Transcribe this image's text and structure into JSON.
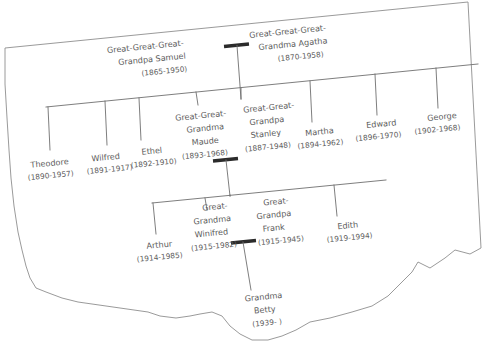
{
  "document": {
    "type": "hand-drawn family tree chart on torn paper",
    "title": "Family Tree",
    "ink_color": "#5c5c5c",
    "paper_color": "#ffffff",
    "edge_color": "#8e8e8e",
    "marriage_bar_color": "#2b2b2b",
    "rotation_degrees": -6
  },
  "generations": [
    {
      "index": 1,
      "label": "great-great-great-grandparents",
      "people": [
        {
          "name": "Great-Great-Great-Grandpa Samuel",
          "line1": "Great-Great-Great-",
          "line2": "Grandpa Samuel",
          "dates": "(1865-1950)",
          "birth": "1865",
          "death": "1950"
        },
        {
          "name": "Great-Great-Great-Grandma Agatha",
          "line1": "Great-Great-Great-",
          "line2": "Grandma Agatha",
          "dates": "(1870-1958)",
          "birth": "1870",
          "death": "1958"
        }
      ],
      "marriage": true
    },
    {
      "index": 2,
      "label": "great-great-grandparents and siblings",
      "people": [
        {
          "name": "Theodore",
          "line1": "Theodore",
          "dates": "(1890-1957)",
          "birth": "1890",
          "death": "1957"
        },
        {
          "name": "Wilfred",
          "line1": "Wilfred",
          "dates": "(1891-1917)",
          "birth": "1891",
          "death": "1917"
        },
        {
          "name": "Ethel",
          "line1": "Ethel",
          "dates": "(1892-1910)",
          "birth": "1892",
          "death": "1910"
        },
        {
          "name": "Great-Great-Grandma Maude",
          "line1": "Great-Great-",
          "line2": "Grandma",
          "line3": "Maude",
          "dates": "(1893-1968)",
          "birth": "1893",
          "death": "1968"
        },
        {
          "name": "Great-Great-Grandpa Stanley",
          "line1": "Great-Great-",
          "line2": "Grandpa",
          "line3": "Stanley",
          "dates": "(1887-1948)",
          "birth": "1887",
          "death": "1948"
        },
        {
          "name": "Martha",
          "line1": "Martha",
          "dates": "(1894-1962)",
          "birth": "1894",
          "death": "1962"
        },
        {
          "name": "Edward",
          "line1": "Edward",
          "dates": "(1896-1970)",
          "birth": "1896",
          "death": "1970"
        },
        {
          "name": "George",
          "line1": "George",
          "dates": "(1902-1968)",
          "birth": "1902",
          "death": "1968"
        }
      ],
      "marriage": true
    },
    {
      "index": 3,
      "label": "great-grandparents and siblings",
      "people": [
        {
          "name": "Arthur",
          "line1": "Arthur",
          "dates": "(1914-1985)",
          "birth": "1914",
          "death": "1985"
        },
        {
          "name": "Great-Grandma Winifred",
          "line1": "Great-",
          "line2": "Grandma",
          "line3": "Winifred",
          "dates": "(1915-1982)",
          "birth": "1915",
          "death": "1982"
        },
        {
          "name": "Great-Grandpa Frank",
          "line1": "Great-",
          "line2": "Grandpa",
          "line3": "Frank",
          "dates": "(1915-1945)",
          "birth": "1915",
          "death": "1945"
        },
        {
          "name": "Edith",
          "line1": "Edith",
          "dates": "(1919-1994)",
          "birth": "1919",
          "death": "1994"
        }
      ],
      "marriage": true
    },
    {
      "index": 4,
      "label": "grandmother",
      "people": [
        {
          "name": "Grandma Betty",
          "line1": "Grandma",
          "line2": "Betty",
          "dates": "(1939-    )",
          "birth": "1939",
          "death": ""
        }
      ],
      "marriage": false
    }
  ],
  "labels": {
    "g1_samuel_l1": "Great-Great-Great-",
    "g1_samuel_l2": "Grandpa Samuel",
    "g1_samuel_dates": "(1865-1950)",
    "g1_agatha_l1": "Great-Great-Great-",
    "g1_agatha_l2": "Grandma Agatha",
    "g1_agatha_dates": "(1870-1958)",
    "g2_theodore": "Theodore",
    "g2_theodore_dates": "(1890-1957)",
    "g2_wilfred": "Wilfred",
    "g2_wilfred_dates": "(1891-1917)",
    "g2_ethel": "Ethel",
    "g2_ethel_dates": "(1892-1910)",
    "g2_maude_l1": "Great-Great-",
    "g2_maude_l2": "Grandma",
    "g2_maude_l3": "Maude",
    "g2_maude_dates": "(1893-1968)",
    "g2_stanley_l1": "Great-Great-",
    "g2_stanley_l2": "Grandpa",
    "g2_stanley_l3": "Stanley",
    "g2_stanley_dates": "(1887-1948)",
    "g2_martha": "Martha",
    "g2_martha_dates": "(1894-1962)",
    "g2_edward": "Edward",
    "g2_edward_dates": "(1896-1970)",
    "g2_george": "George",
    "g2_george_dates": "(1902-1968)",
    "g3_arthur": "Arthur",
    "g3_arthur_dates": "(1914-1985)",
    "g3_winifred_l1": "Great-",
    "g3_winifred_l2": "Grandma",
    "g3_winifred_l3": "Winifred",
    "g3_winifred_dates": "(1915-1982)",
    "g3_frank_l1": "Great-",
    "g3_frank_l2": "Grandpa",
    "g3_frank_l3": "Frank",
    "g3_frank_dates": "(1915-1945)",
    "g3_edith": "Edith",
    "g3_edith_dates": "(1919-1994)",
    "g4_betty_l1": "Grandma",
    "g4_betty_l2": "Betty",
    "g4_betty_dates": "(1939-    )"
  }
}
